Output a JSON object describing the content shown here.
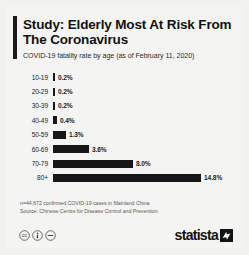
{
  "header": {
    "title": "Study: Elderly Most At Risk From The Coronavirus",
    "subtitle": "COVID-19 fatality rate by age (as of February 11, 2020)"
  },
  "chart_data": {
    "type": "bar",
    "orientation": "horizontal",
    "title": "Study: Elderly Most At Risk From The Coronavirus",
    "subtitle": "COVID-19 fatality rate by age (as of February 11, 2020)",
    "xlabel": "",
    "ylabel": "",
    "grid": false,
    "legend": "none",
    "xlim": [
      0,
      14.8
    ],
    "categories": [
      "10-19",
      "20-29",
      "30-39",
      "40-49",
      "50-59",
      "60-69",
      "70-79",
      "80+"
    ],
    "values": [
      0.2,
      0.2,
      0.2,
      0.4,
      1.3,
      3.6,
      8.0,
      14.8
    ],
    "value_labels": [
      "0.2%",
      "0.2%",
      "0.2%",
      "0.4%",
      "1.3%",
      "3.6%",
      "8.0%",
      "14.8%"
    ],
    "bar_color": "#17171a"
  },
  "notes": {
    "line1": "n=44,672 confirmed COVID-19 cases in Mainland China",
    "line2": "Source: Chinese Centre for Disease Control and Prevention"
  },
  "footer": {
    "license_icons": [
      "cc-icon",
      "cc-by-icon",
      "cc-nd-icon"
    ],
    "logo_text": "statista",
    "logo_mark": "statista-arrow-mark"
  },
  "colors": {
    "background": "#f2f2f0",
    "card": "#f4f4f2",
    "bar": "#17171a",
    "title": "#121212",
    "note": "#5d5d5d"
  }
}
